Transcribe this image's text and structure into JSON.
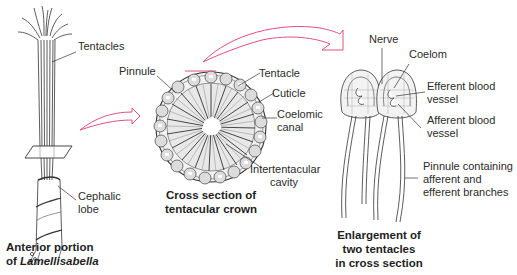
{
  "figure": {
    "accent_color": "#e0507a",
    "panels": [
      {
        "id": "anterior",
        "caption_line1": "Anterior portion",
        "caption_line2_prefix": "of ",
        "caption_line2_italic": "Lamellisabella",
        "labels": {
          "tentacles": "Tentacles",
          "cephalic_lobe_1": "Cephalic",
          "cephalic_lobe_2": "lobe"
        }
      },
      {
        "id": "cross-section",
        "caption_line1": "Cross section of",
        "caption_line2": "tentacular crown",
        "labels": {
          "pinnule": "Pinnule",
          "tentacle": "Tentacle",
          "cuticle": "Cuticle",
          "coelomic_canal_1": "Coelomic",
          "coelomic_canal_2": "canal",
          "intertentacular_1": "Intertentacular",
          "intertentacular_2": "cavity"
        }
      },
      {
        "id": "enlargement",
        "caption_line1": "Enlargement of",
        "caption_line2": "two tentacles",
        "caption_line3": "in cross section",
        "labels": {
          "nerve": "Nerve",
          "coelom": "Coelom",
          "efferent_1": "Efferent blood",
          "efferent_2": "vessel",
          "afferent_1": "Afferent blood",
          "afferent_2": "vessel",
          "pinnule_1": "Pinnule containing",
          "pinnule_2": "afferent and",
          "pinnule_3": "efferent branches"
        }
      }
    ],
    "arrows": [
      {
        "from": "anterior",
        "to": "cross-section"
      },
      {
        "from": "cross-section",
        "to": "enlargement"
      }
    ]
  }
}
